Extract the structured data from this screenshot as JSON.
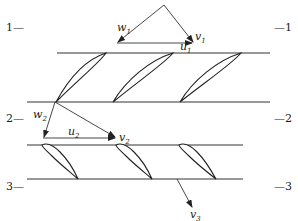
{
  "diagram": {
    "type": "turbine stage velocity triangles with blade cascades",
    "section_labels": {
      "left": [
        "1—",
        "2—",
        "3—"
      ],
      "right": [
        "—1",
        "—2",
        "—3"
      ]
    },
    "vectors": {
      "w1": {
        "symbol": "w",
        "sub": "1"
      },
      "v1": {
        "symbol": "v",
        "sub": "1"
      },
      "u1": {
        "symbol": "u",
        "sub": "1"
      },
      "w2": {
        "symbol": "w",
        "sub": "2"
      },
      "u2": {
        "symbol": "u",
        "sub": "2"
      },
      "v2": {
        "symbol": "v",
        "sub": "2"
      },
      "v3": {
        "symbol": "v",
        "sub": "3"
      }
    },
    "rows": [
      {
        "name": "rotor-cascade",
        "blade_count": 3
      },
      {
        "name": "stator-cascade",
        "blade_count": 3
      }
    ],
    "colors": {
      "ink": "#222222",
      "background": "#ffffff"
    }
  }
}
